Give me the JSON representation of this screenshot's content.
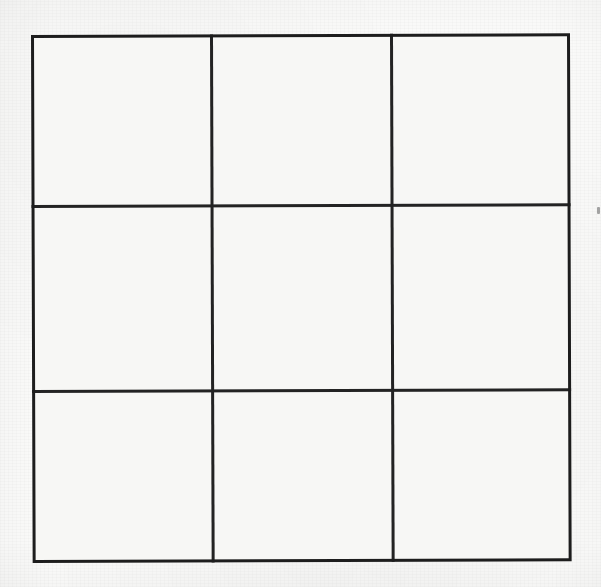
{
  "document": {
    "kind": "scanned-paper-drawing",
    "title": "Blank 3x3 grid",
    "canvas_width": 601,
    "canvas_height": 587
  },
  "colors": {
    "page_background": "#fbfbfa",
    "paper_fill": "#f7f7f5",
    "outer_border_ink": "#1d1d1d",
    "interior_rule_ink": "#232323",
    "speck_ink": "#505050"
  },
  "grid": {
    "rows": 3,
    "columns": 3,
    "outer_left": 31,
    "outer_top": 35,
    "outer_width": 539,
    "outer_height": 528,
    "rotation_deg": -0.18,
    "outer_border_width_px": 3.5,
    "interior_rule_width_px": 2.6,
    "column_boundaries_px": [
      179,
      359
    ],
    "row_boundaries_px": [
      170,
      355
    ],
    "column_widths_px": [
      179,
      180,
      180
    ],
    "row_heights_px": [
      170,
      185,
      173
    ],
    "cells": [
      {
        "id": "r1c1",
        "row": 1,
        "column": 1,
        "content": ""
      },
      {
        "id": "r1c2",
        "row": 1,
        "column": 2,
        "content": ""
      },
      {
        "id": "r1c3",
        "row": 1,
        "column": 3,
        "content": ""
      },
      {
        "id": "r2c1",
        "row": 2,
        "column": 1,
        "content": ""
      },
      {
        "id": "r2c2",
        "row": 2,
        "column": 2,
        "content": ""
      },
      {
        "id": "r2c3",
        "row": 2,
        "column": 3,
        "content": ""
      },
      {
        "id": "r3c1",
        "row": 3,
        "column": 1,
        "content": ""
      },
      {
        "id": "r3c2",
        "row": 3,
        "column": 2,
        "content": ""
      },
      {
        "id": "r3c3",
        "row": 3,
        "column": 3,
        "content": ""
      }
    ]
  },
  "artifacts": {
    "edge_speck": {
      "x": 597,
      "y": 207,
      "width": 3,
      "height": 7
    }
  }
}
